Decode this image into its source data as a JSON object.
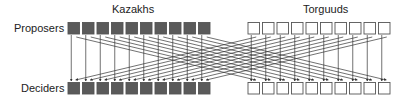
{
  "diagram": {
    "groups": [
      {
        "name": "Kazakhs",
        "count": 10,
        "style": "filled",
        "fill": "#5a5a5a"
      },
      {
        "name": "Torguuds",
        "count": 10,
        "style": "open",
        "fill": "#ffffff"
      }
    ],
    "rows": {
      "top": "Proposers",
      "bottom": "Deciders"
    },
    "connections": "Each proposer points to the decider directly below it (own group) and to the same-index decider in the other group",
    "colors": {
      "filled_box": "#5a5a5a",
      "box_border": "#555555",
      "line": "#333333",
      "text": "#222222"
    }
  }
}
